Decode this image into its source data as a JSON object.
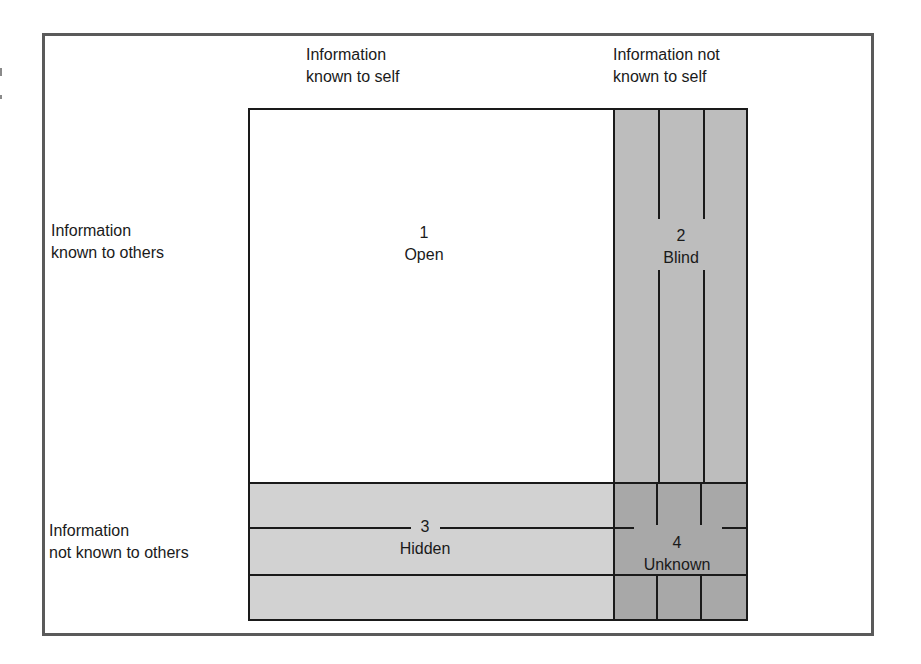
{
  "diagram": {
    "type": "johari-window",
    "column_headers": [
      {
        "line1": "Information",
        "line2": "known to self"
      },
      {
        "line1": "Information not",
        "line2": "known to self"
      }
    ],
    "row_headers": [
      {
        "line1": "Information",
        "line2": "known to others"
      },
      {
        "line1": "Information",
        "line2": "not known to others"
      }
    ],
    "quadrants": [
      {
        "number": "1",
        "name": "Open",
        "color": "#ffffff"
      },
      {
        "number": "2",
        "name": "Blind",
        "color": "#bdbdbd"
      },
      {
        "number": "3",
        "name": "Hidden",
        "color": "#d2d2d2"
      },
      {
        "number": "4",
        "name": "Unknown",
        "color": "#a8a8a8"
      }
    ]
  }
}
